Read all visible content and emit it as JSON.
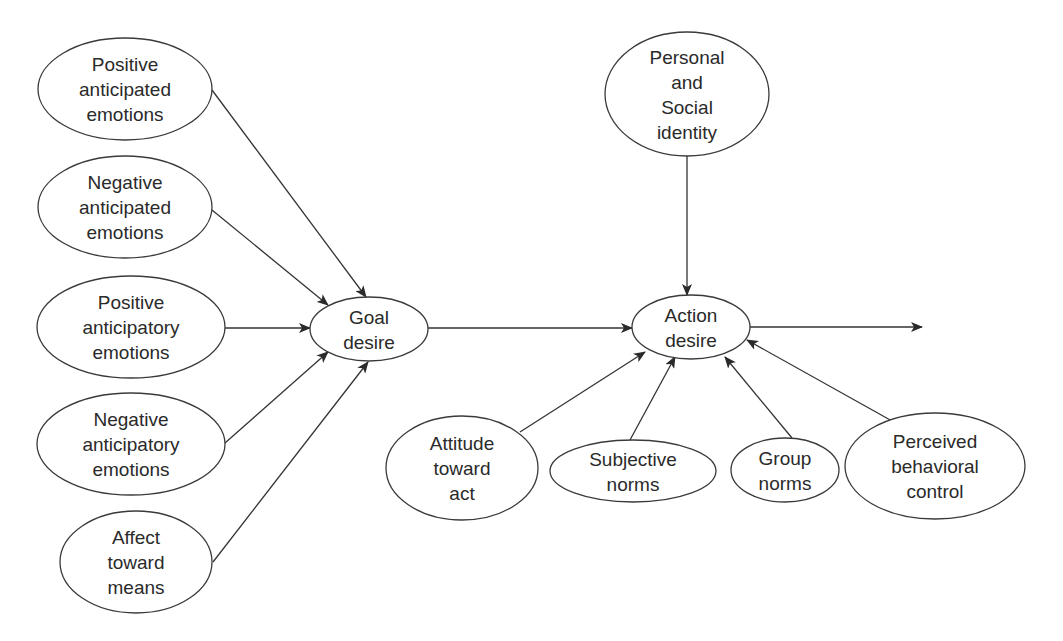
{
  "diagram": {
    "title": "",
    "nodes": [
      {
        "id": "pos_anticipated",
        "lines": [
          "Positive",
          "anticipated",
          "emotions"
        ],
        "cx": 125,
        "cy": 89,
        "rx": 87,
        "ry": 51
      },
      {
        "id": "neg_anticipated",
        "lines": [
          "Negative",
          "anticipated",
          "emotions"
        ],
        "cx": 125,
        "cy": 207,
        "rx": 87,
        "ry": 51
      },
      {
        "id": "pos_anticipatory",
        "lines": [
          "Positive",
          "anticipatory",
          "emotions"
        ],
        "cx": 131,
        "cy": 327,
        "rx": 94,
        "ry": 51
      },
      {
        "id": "neg_anticipatory",
        "lines": [
          "Negative",
          "anticipatory",
          "emotions"
        ],
        "cx": 131,
        "cy": 444,
        "rx": 94,
        "ry": 51
      },
      {
        "id": "affect_means",
        "lines": [
          "Affect",
          "toward",
          "means"
        ],
        "cx": 136,
        "cy": 562,
        "rx": 76,
        "ry": 51
      },
      {
        "id": "goal_desire",
        "lines": [
          "Goal",
          "desire"
        ],
        "cx": 369,
        "cy": 329,
        "rx": 59,
        "ry": 32
      },
      {
        "id": "action_desire",
        "lines": [
          "Action",
          "desire"
        ],
        "cx": 691,
        "cy": 327,
        "rx": 59,
        "ry": 32
      },
      {
        "id": "identity",
        "lines": [
          "Personal",
          "and",
          "Social",
          "identity"
        ],
        "cx": 687,
        "cy": 94,
        "rx": 82,
        "ry": 62
      },
      {
        "id": "attitude_act",
        "lines": [
          "Attitude",
          "toward",
          "act"
        ],
        "cx": 462,
        "cy": 468,
        "rx": 76,
        "ry": 52
      },
      {
        "id": "subjective_norms",
        "lines": [
          "Subjective",
          "norms"
        ],
        "cx": 633,
        "cy": 471,
        "rx": 83,
        "ry": 31
      },
      {
        "id": "group_norms",
        "lines": [
          "Group",
          "norms"
        ],
        "cx": 785,
        "cy": 470,
        "rx": 54,
        "ry": 32
      },
      {
        "id": "pbc",
        "lines": [
          "Perceived",
          "behavioral",
          "control"
        ],
        "cx": 935,
        "cy": 466,
        "rx": 90,
        "ry": 53
      }
    ],
    "edges": [
      {
        "from": "pos_anticipated",
        "to": "goal_desire",
        "x1": 212,
        "y1": 90,
        "x2": 366,
        "y2": 297
      },
      {
        "from": "neg_anticipated",
        "to": "goal_desire",
        "x1": 212,
        "y1": 210,
        "x2": 328,
        "y2": 305
      },
      {
        "from": "pos_anticipatory",
        "to": "goal_desire",
        "x1": 225,
        "y1": 328,
        "x2": 310,
        "y2": 328
      },
      {
        "from": "neg_anticipatory",
        "to": "goal_desire",
        "x1": 225,
        "y1": 443,
        "x2": 328,
        "y2": 352
      },
      {
        "from": "affect_means",
        "to": "goal_desire",
        "x1": 213,
        "y1": 562,
        "x2": 368,
        "y2": 362
      },
      {
        "from": "goal_desire",
        "to": "action_desire",
        "x1": 428,
        "y1": 328,
        "x2": 632,
        "y2": 328
      },
      {
        "from": "identity",
        "to": "action_desire",
        "x1": 687,
        "y1": 156,
        "x2": 687,
        "y2": 295
      },
      {
        "from": "attitude_act",
        "to": "action_desire",
        "x1": 520,
        "y1": 432,
        "x2": 645,
        "y2": 352
      },
      {
        "from": "subjective_norms",
        "to": "action_desire",
        "x1": 630,
        "y1": 440,
        "x2": 675,
        "y2": 357
      },
      {
        "from": "group_norms",
        "to": "action_desire",
        "x1": 792,
        "y1": 438,
        "x2": 725,
        "y2": 357
      },
      {
        "from": "pbc",
        "to": "action_desire",
        "x1": 892,
        "y1": 421,
        "x2": 747,
        "y2": 340
      },
      {
        "from": "action_desire",
        "to": "output",
        "x1": 750,
        "y1": 327,
        "x2": 922,
        "y2": 327
      }
    ],
    "colors": {
      "stroke": "#3a3a3a",
      "text": "#2a2a2a",
      "background": "#ffffff"
    }
  }
}
